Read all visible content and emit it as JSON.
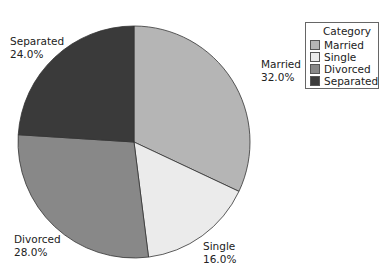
{
  "chart_data": {
    "type": "pie",
    "title": "",
    "legend_title": "Category",
    "legend_position": "right",
    "start_angle": "12 o'clock, clockwise",
    "slices": [
      {
        "label": "Married",
        "value": 32.0,
        "display": "32.0%",
        "color": "#b5b5b5"
      },
      {
        "label": "Single",
        "value": 16.0,
        "display": "16.0%",
        "color": "#ebebeb"
      },
      {
        "label": "Divorced",
        "value": 28.0,
        "display": "28.0%",
        "color": "#888888"
      },
      {
        "label": "Separated",
        "value": 24.0,
        "display": "24.0%",
        "color": "#3a3a3a"
      }
    ]
  },
  "labels": {
    "married": {
      "name": "Married",
      "pct": "32.0%"
    },
    "single": {
      "name": "Single",
      "pct": "16.0%"
    },
    "divorced": {
      "name": "Divorced",
      "pct": "28.0%"
    },
    "separated": {
      "name": "Separated",
      "pct": "24.0%"
    }
  },
  "legend": {
    "title": "Category",
    "items": [
      "Married",
      "Single",
      "Divorced",
      "Separated"
    ]
  }
}
